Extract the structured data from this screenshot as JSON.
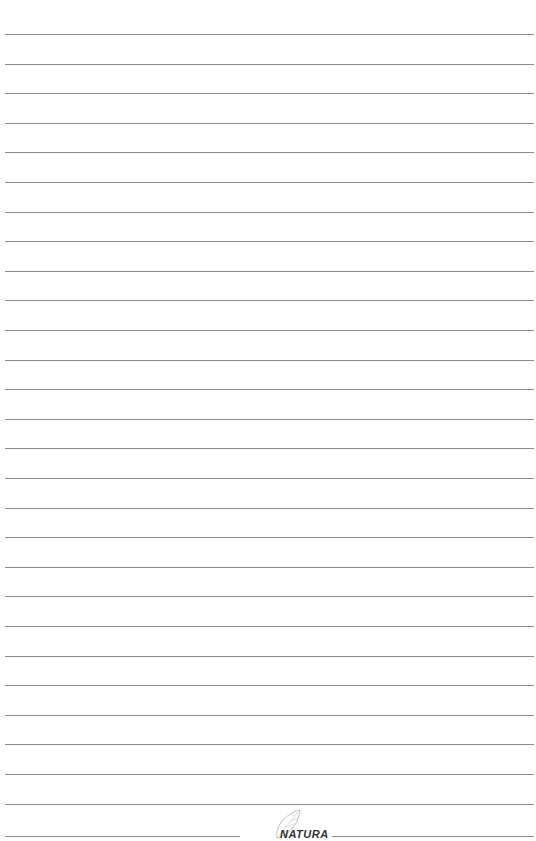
{
  "page": {
    "type": "lined-notebook-page",
    "background_color": "#ffffff",
    "line_color": "#8a8a8a",
    "line_count": 27,
    "line_spacing_px": 29.6,
    "first_line_y": 34
  },
  "footer": {
    "logo_icon": "leaf-logo-icon",
    "logo_text": "NATURA"
  }
}
